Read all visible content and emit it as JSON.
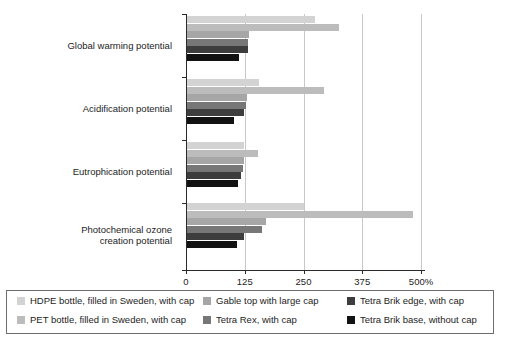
{
  "chart_data": {
    "type": "bar",
    "orientation": "horizontal",
    "title": "",
    "xlabel": "",
    "ylabel": "",
    "xlim": [
      0,
      500
    ],
    "xticks": [
      0,
      125,
      250,
      375,
      500
    ],
    "xtick_labels": [
      "0",
      "125",
      "250",
      "375",
      "500%"
    ],
    "grid": true,
    "legend_position": "bottom",
    "categories": [
      "Global warming potential",
      "Acidification potential",
      "Eutrophication potential",
      "Photochemical ozone\ncreation potential"
    ],
    "series": [
      {
        "name": "HDPE bottle, filled in Sweden, with cap",
        "color": "#d3d3d3",
        "values": [
          274,
          155,
          123,
          250
        ]
      },
      {
        "name": "PET bottle, filled in Sweden, with cap",
        "color": "#bcbcbc",
        "values": [
          325,
          293,
          153,
          483
        ]
      },
      {
        "name": "Gable top with large cap",
        "color": "#a6a6a6",
        "values": [
          133,
          129,
          123,
          170
        ]
      },
      {
        "name": "Tetra Rex, with cap",
        "color": "#777777",
        "values": [
          131,
          127,
          122,
          161
        ]
      },
      {
        "name": "Tetra Brik edge, with cap",
        "color": "#3d3d3d",
        "values": [
          131,
          124,
          116,
          123
        ]
      },
      {
        "name": "Tetra Brik base, without cap",
        "color": "#121212",
        "values": [
          112,
          103,
          110,
          108
        ]
      }
    ]
  },
  "categories_display": [
    {
      "line1": "Global warming potential",
      "line2": ""
    },
    {
      "line1": "Acidification potential",
      "line2": ""
    },
    {
      "line1": "Eutrophication potential",
      "line2": ""
    },
    {
      "line1": "Photochemical ozone",
      "line2": "creation potential"
    }
  ],
  "axis": {
    "tick_labels": [
      "0",
      "125",
      "250",
      "375",
      "500%"
    ]
  },
  "legend": {
    "items": [
      {
        "label": "HDPE bottle, filled in Sweden, with cap",
        "color": "#d3d3d3"
      },
      {
        "label": "PET bottle, filled in Sweden, with cap",
        "color": "#bcbcbc"
      },
      {
        "label": "Gable top with large cap",
        "color": "#a6a6a6"
      },
      {
        "label": "Tetra Rex, with cap",
        "color": "#777777"
      },
      {
        "label": "Tetra Brik edge, with cap",
        "color": "#3d3d3d"
      },
      {
        "label": "Tetra Brik base, without cap",
        "color": "#121212"
      }
    ]
  }
}
